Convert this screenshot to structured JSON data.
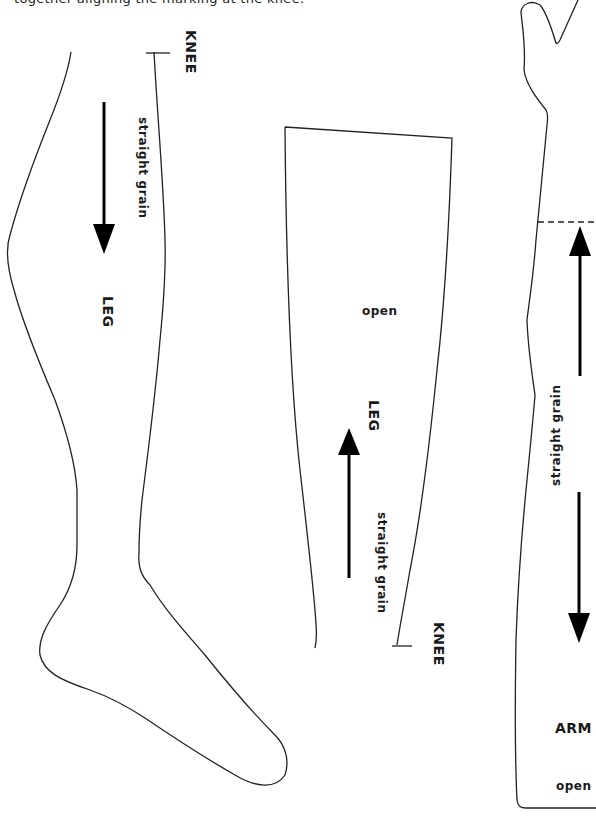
{
  "instructions": {
    "text": "together aligning the marking at the knee."
  },
  "pieces": {
    "leg_left": {
      "name": "LEG",
      "knee_label": "KNEE",
      "grain_label": "straight grain",
      "grain_direction": "down"
    },
    "leg_middle": {
      "name": "LEG",
      "knee_label": "KNEE",
      "grain_label": "straight grain",
      "open_label": "open",
      "grain_direction": "up"
    },
    "arm_right": {
      "name": "ARM",
      "grain_label": "straight grain",
      "open_label": "open",
      "grain_direction": "both"
    }
  },
  "colors": {
    "outline": "#222222",
    "text": "#1a1a1a",
    "background": "#ffffff"
  }
}
